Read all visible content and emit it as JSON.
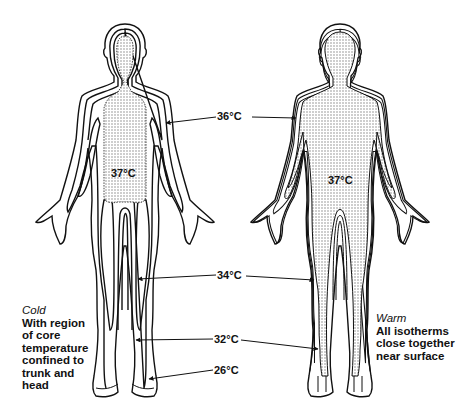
{
  "figures": {
    "cold": {
      "title": "Cold",
      "description_lines": [
        "With region",
        "of core",
        "temperature",
        "confined to",
        "trunk and",
        "head"
      ],
      "core_label": "37°C"
    },
    "warm": {
      "title": "Warm",
      "description_lines": [
        "All isotherms",
        "close together",
        "near surface"
      ],
      "core_label": "37°C"
    }
  },
  "isotherms": [
    {
      "label": "36°C"
    },
    {
      "label": "34°C"
    },
    {
      "label": "32°C"
    },
    {
      "label": "26°C"
    }
  ],
  "colors": {
    "stroke": "#111111",
    "stipple": "#bdbdbd",
    "background": "#ffffff"
  }
}
